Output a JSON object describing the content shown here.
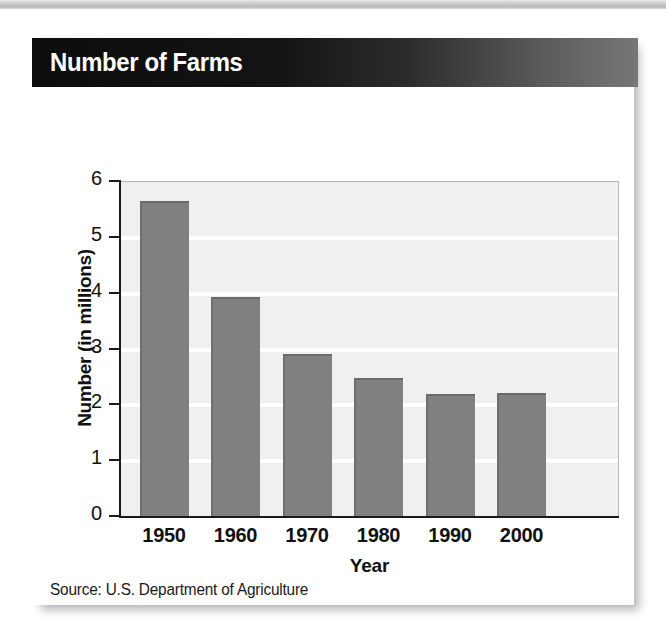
{
  "figure": {
    "title": "Number of Farms",
    "source": "Source: U.S. Department of Agriculture"
  },
  "colors": {
    "bar_fill": "#808080",
    "bar_edge": "#6a6a6a",
    "header_dark": "#0d0d0d",
    "header_light": "#777777",
    "plot_background": "#f0f0f0",
    "gridline": "#ffffff",
    "axis": "#1a1a1a",
    "text": "#111111"
  },
  "chart_data": {
    "type": "bar",
    "title": "Number of Farms",
    "categories": [
      "1950",
      "1960",
      "1970",
      "1980",
      "1990",
      "2000"
    ],
    "values": [
      5.65,
      3.92,
      2.9,
      2.48,
      2.18,
      2.2
    ],
    "xlabel": "Year",
    "ylabel": "Number (in millions)",
    "ylim": [
      0,
      6
    ],
    "yticks": [
      0,
      1,
      2,
      3,
      4,
      5,
      6
    ],
    "ytick_labels": [
      "0",
      "1",
      "2",
      "3",
      "4",
      "5",
      "6"
    ],
    "grid": true,
    "legend": null,
    "source": "Source: U.S. Department of Agriculture"
  }
}
